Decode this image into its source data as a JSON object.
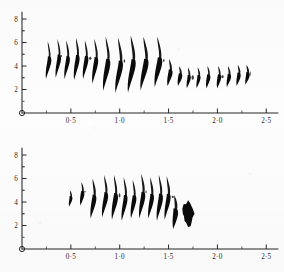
{
  "figure": {
    "background_color": "#fdfdfd",
    "ink_color": "#0b0b0b",
    "axis_color": "#262626",
    "panel_count": 2
  },
  "panels": [
    {
      "id": "panel-top",
      "name": "upper-plot",
      "x_axis": {
        "label": "",
        "ticks": [
          "0·5",
          "1·0",
          "1·5",
          "2·0",
          "2·5"
        ],
        "tick_values": [
          0.5,
          1.0,
          1.5,
          2.0,
          2.5
        ],
        "range": [
          0,
          2.62
        ],
        "minor_ticks_per_major": 1
      },
      "y_axis": {
        "label": "",
        "ticks": [
          "8",
          "6",
          "4",
          "2"
        ],
        "tick_values": [
          8,
          6,
          4,
          2
        ],
        "range": [
          0,
          8.6
        ],
        "minor_ticks_per_major": 1
      },
      "origin_marker": "open-circle"
    },
    {
      "id": "panel-bottom",
      "name": "lower-plot",
      "x_axis": {
        "label": "",
        "ticks": [
          "0·5",
          "1·0",
          "1·5",
          "2·0",
          "2·5"
        ],
        "tick_values": [
          0.5,
          1.0,
          1.5,
          2.0,
          2.5
        ],
        "range": [
          0,
          2.62
        ],
        "minor_ticks_per_major": 1
      },
      "y_axis": {
        "label": "",
        "ticks": [
          "8",
          "6",
          "4",
          "2"
        ],
        "tick_values": [
          8,
          6,
          4,
          2
        ],
        "range": [
          0,
          8.6
        ],
        "minor_ticks_per_major": 1
      },
      "origin_marker": "open-circle"
    }
  ],
  "chart_data": [
    {
      "type": "line",
      "name": "upper-plot",
      "title": "",
      "xlabel": "",
      "ylabel": "",
      "xlim": [
        0,
        2.62
      ],
      "ylim": [
        0,
        8.6
      ],
      "xticks": [
        0.5,
        1.0,
        1.5,
        2.0,
        2.5
      ],
      "xticklabels": [
        "0·5",
        "1·0",
        "1·5",
        "2·0",
        "2·5"
      ],
      "yticks": [
        2,
        4,
        6,
        8
      ],
      "yticklabels": [
        "2",
        "4",
        "6",
        "8"
      ],
      "grid": false,
      "legend": "none",
      "series": [
        {
          "name": "spike-envelope",
          "description": "Sequence of leftward-leaning teardrop spikes; each spike has an upper thin tail and a lower filled blade.",
          "spikes": [
            {
              "x": 0.28,
              "top": 6.1,
              "bottom": 2.9,
              "width": 0.035,
              "lean": -0.03
            },
            {
              "x": 0.38,
              "top": 6.3,
              "bottom": 3.0,
              "width": 0.035,
              "lean": -0.03
            },
            {
              "x": 0.47,
              "top": 6.2,
              "bottom": 2.9,
              "width": 0.035,
              "lean": -0.03
            },
            {
              "x": 0.57,
              "top": 6.4,
              "bottom": 2.8,
              "width": 0.038,
              "lean": -0.032
            },
            {
              "x": 0.66,
              "top": 6.2,
              "bottom": 2.9,
              "width": 0.036,
              "lean": -0.03
            },
            {
              "x": 0.76,
              "top": 6.3,
              "bottom": 2.5,
              "width": 0.04,
              "lean": -0.034
            },
            {
              "x": 0.88,
              "top": 6.5,
              "bottom": 1.9,
              "width": 0.044,
              "lean": -0.042
            },
            {
              "x": 1.01,
              "top": 6.4,
              "bottom": 1.7,
              "width": 0.046,
              "lean": -0.046
            },
            {
              "x": 1.14,
              "top": 6.6,
              "bottom": 1.7,
              "width": 0.048,
              "lean": -0.048
            },
            {
              "x": 1.27,
              "top": 6.5,
              "bottom": 1.9,
              "width": 0.048,
              "lean": -0.048
            },
            {
              "x": 1.41,
              "top": 6.5,
              "bottom": 2.2,
              "width": 0.046,
              "lean": -0.044
            },
            {
              "x": 1.52,
              "top": 4.6,
              "bottom": 2.3,
              "width": 0.04,
              "lean": -0.026
            },
            {
              "x": 1.62,
              "top": 4.0,
              "bottom": 2.3,
              "width": 0.034,
              "lean": -0.02
            },
            {
              "x": 1.71,
              "top": 3.9,
              "bottom": 2.1,
              "width": 0.034,
              "lean": -0.02
            },
            {
              "x": 1.81,
              "top": 3.9,
              "bottom": 2.1,
              "width": 0.034,
              "lean": -0.02
            },
            {
              "x": 1.91,
              "top": 4.0,
              "bottom": 2.1,
              "width": 0.034,
              "lean": -0.02
            },
            {
              "x": 2.02,
              "top": 4.0,
              "bottom": 2.1,
              "width": 0.034,
              "lean": -0.02
            },
            {
              "x": 2.12,
              "top": 4.0,
              "bottom": 2.2,
              "width": 0.034,
              "lean": -0.02
            },
            {
              "x": 2.22,
              "top": 4.1,
              "bottom": 2.3,
              "width": 0.034,
              "lean": -0.02
            },
            {
              "x": 2.31,
              "top": 4.1,
              "bottom": 2.4,
              "width": 0.034,
              "lean": -0.02
            }
          ]
        }
      ]
    },
    {
      "type": "line",
      "name": "lower-plot",
      "title": "",
      "xlabel": "",
      "ylabel": "",
      "xlim": [
        0,
        2.62
      ],
      "ylim": [
        0,
        8.6
      ],
      "xticks": [
        0.5,
        1.0,
        1.5,
        2.0,
        2.5
      ],
      "xticklabels": [
        "0·5",
        "1·0",
        "1·5",
        "2·0",
        "2·5"
      ],
      "yticks": [
        2,
        4,
        6,
        8
      ],
      "yticklabels": [
        "2",
        "4",
        "6",
        "8"
      ],
      "grid": false,
      "legend": "none",
      "series": [
        {
          "name": "spike-envelope",
          "description": "Spikes grow from ~5 to ~6.5 then terminate in a dense ink blob near x = 1.7.",
          "spikes": [
            {
              "x": 0.5,
              "top": 5.0,
              "bottom": 3.6,
              "width": 0.03,
              "lean": -0.016
            },
            {
              "x": 0.62,
              "top": 5.7,
              "bottom": 3.7,
              "width": 0.032,
              "lean": -0.02
            },
            {
              "x": 0.74,
              "top": 6.0,
              "bottom": 2.6,
              "width": 0.038,
              "lean": -0.032
            },
            {
              "x": 0.86,
              "top": 6.3,
              "bottom": 2.7,
              "width": 0.038,
              "lean": -0.034
            },
            {
              "x": 0.96,
              "top": 6.3,
              "bottom": 2.5,
              "width": 0.04,
              "lean": -0.034
            },
            {
              "x": 1.06,
              "top": 6.1,
              "bottom": 2.4,
              "width": 0.04,
              "lean": -0.034
            },
            {
              "x": 1.15,
              "top": 5.9,
              "bottom": 2.6,
              "width": 0.038,
              "lean": -0.03
            },
            {
              "x": 1.24,
              "top": 6.4,
              "bottom": 2.6,
              "width": 0.04,
              "lean": -0.034
            },
            {
              "x": 1.33,
              "top": 6.1,
              "bottom": 2.6,
              "width": 0.04,
              "lean": -0.032
            },
            {
              "x": 1.42,
              "top": 6.3,
              "bottom": 2.4,
              "width": 0.04,
              "lean": -0.034
            },
            {
              "x": 1.5,
              "top": 6.2,
              "bottom": 2.5,
              "width": 0.04,
              "lean": -0.034
            },
            {
              "x": 1.57,
              "top": 4.6,
              "bottom": 1.7,
              "width": 0.046,
              "lean": -0.02
            }
          ],
          "terminal_blob": {
            "x": 1.7,
            "y_center": 3.0,
            "rx": 0.055,
            "ry": 0.95
          }
        }
      ]
    }
  ]
}
